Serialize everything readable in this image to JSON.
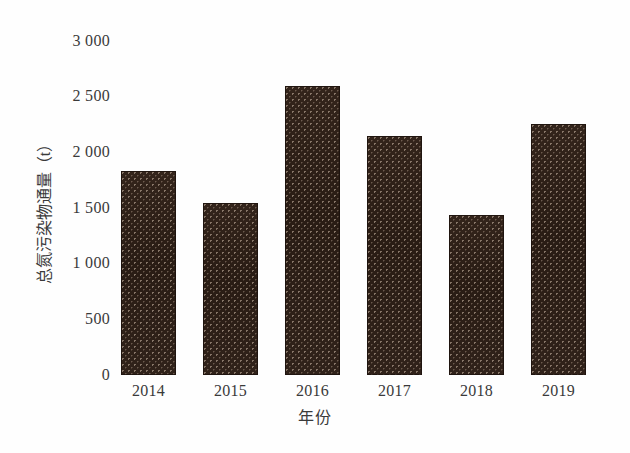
{
  "chart_data": {
    "type": "bar",
    "title": "",
    "subtitle": "",
    "xlabel": "年份",
    "ylabel": "总氮污染物通量（t）",
    "categories": [
      "2014",
      "2015",
      "2016",
      "2017",
      "2018",
      "2019"
    ],
    "values": [
      1830,
      1545,
      2595,
      2150,
      1435,
      2255
    ],
    "series": [
      {
        "name": "总氮污染物通量",
        "values": [
          1830,
          1545,
          2595,
          2150,
          1435,
          2255
        ]
      }
    ],
    "ylim": [
      0,
      3000
    ],
    "yticks": [
      "0",
      "500",
      "1 000",
      "1 500",
      "2 000",
      "2 500",
      "3 000"
    ],
    "ytick_values": [
      0,
      500,
      1000,
      1500,
      2000,
      2500,
      3000
    ],
    "grid": false,
    "legend": "none",
    "bar_color": "#2e2018",
    "bar_fill_pattern": "dark-dotted-texture",
    "axis_text_color": "#3a3a3a",
    "background_color": "#ffffff"
  }
}
